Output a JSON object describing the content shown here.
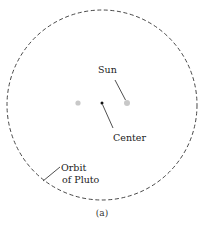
{
  "diagram": {
    "caption": "(a)",
    "orbit": {
      "label_line1": "Orbit",
      "label_line2": "of Pluto",
      "stroke": "#333333",
      "style": "dashed"
    },
    "sun": {
      "label": "Sun",
      "color": "#c8c8c8"
    },
    "center": {
      "label": "Center",
      "color": "#111111"
    },
    "other_body": {
      "color": "#c8c8c8"
    }
  }
}
